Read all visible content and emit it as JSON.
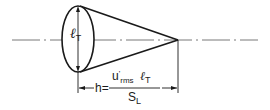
{
  "diagram": {
    "type": "turbulent flame cone schematic",
    "diameter_label": {
      "symbol": "ℓ",
      "subscript": "T"
    },
    "height_formula": {
      "lhs": "h",
      "equals": "=",
      "numerator": {
        "main": "u",
        "prime": "'",
        "subscript": "rms",
        "factor_symbol": "ℓ",
        "factor_subscript": "T"
      },
      "denominator": {
        "main": "S",
        "subscript": "L"
      }
    },
    "colors": {
      "stroke": "#1a1a1a",
      "centerline": "#555555",
      "background": "#ffffff"
    }
  }
}
